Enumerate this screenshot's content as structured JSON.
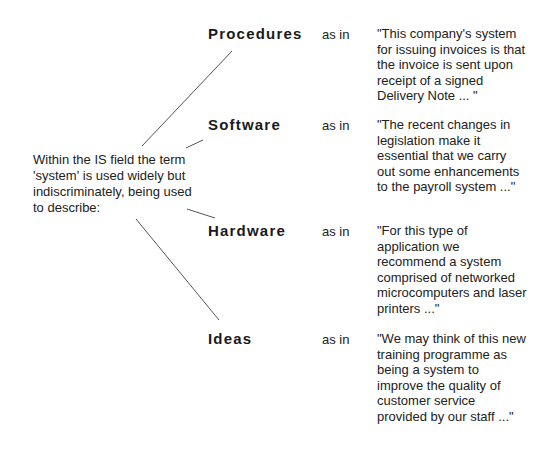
{
  "intro": "Within the IS field the term 'system' is used widely but indiscriminately, being used to describe:",
  "rows": [
    {
      "term": "Procedures",
      "connector": "as in",
      "example": "\"This company's system for issuing invoices is that the invoice is sent upon receipt of a signed Delivery Note ... \""
    },
    {
      "term": "Software",
      "connector": "as in",
      "example": "\"The recent changes in legislation make it essential that we carry out some enhancements to the payroll system ...\""
    },
    {
      "term": "Hardware",
      "connector": "as in",
      "example": "\"For this type of application we recommend a system comprised of networked microcomputers and laser printers ...\""
    },
    {
      "term": "Ideas",
      "connector": "as in",
      "example": "\"We may think of this new training programme as being a system to improve the quality of customer service provided by our staff ...\""
    }
  ],
  "colors": {
    "text": "#222222",
    "line": "#555555",
    "background": "#ffffff"
  }
}
